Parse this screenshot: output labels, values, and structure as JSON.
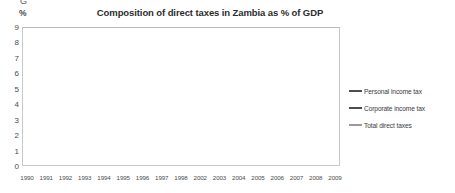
{
  "chart_data": {
    "type": "line",
    "title": "Composition of direct taxes in Zambia as % of GDP",
    "xlabel": "",
    "ylabel": "%",
    "ylim": [
      0,
      9
    ],
    "ytick_step": 1,
    "grid": true,
    "legend_position": "right",
    "categories": [
      "1990",
      "1991",
      "1992",
      "1993",
      "1994",
      "1995",
      "1996",
      "1997",
      "1998",
      "2002",
      "2003",
      "2004",
      "2005",
      "2006",
      "2007",
      "2008",
      "2009"
    ],
    "x_axis_note": "Years 1999-2001 are not shown on the axis",
    "series": [
      {
        "name": "Personal income tax",
        "color": "#4d4d4d",
        "values": [
          1.6,
          2.2,
          2.9,
          2.6,
          3.4,
          4.0,
          4.1,
          4.2,
          4.4,
          6.0,
          7.0,
          6.4,
          6.4,
          6.3,
          6.0,
          5.7,
          5.6
        ]
      },
      {
        "name": "Corporate income tax",
        "color": "#4d4d4d",
        "values": [
          6.2,
          4.4,
          2.6,
          3.1,
          2.3,
          1.6,
          1.7,
          1.7,
          1.7,
          2.0,
          1.8,
          2.0,
          2.1,
          2.2,
          2.9,
          2.7,
          2.2
        ]
      },
      {
        "name": "Total direct taxes",
        "color": "#9a9a9a",
        "values": [
          8.0,
          7.3,
          6.8,
          6.5,
          6.4,
          5.7,
          5.8,
          5.9,
          6.0,
          7.2,
          6.9,
          7.0,
          6.8,
          6.6,
          7.1,
          6.8,
          7.6
        ]
      }
    ],
    "yticks": [
      "9",
      "8",
      "7",
      "6",
      "5",
      "4",
      "3",
      "2",
      "1",
      "0"
    ]
  },
  "axis": {
    "unit_label": "%",
    "clipped_glyph": "G"
  },
  "legend": {
    "items": [
      {
        "label": "Personal income tax",
        "color": "#4d4d4d"
      },
      {
        "label": "Corporate income tax",
        "color": "#4d4d4d"
      },
      {
        "label": "Total direct taxes",
        "color": "#9a9a9a"
      }
    ]
  }
}
